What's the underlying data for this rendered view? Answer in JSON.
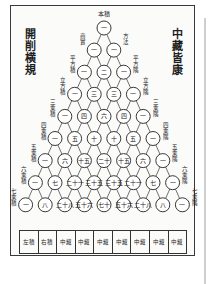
{
  "document": {
    "title_left": "開削横規",
    "title_right": "中藏皆康",
    "apex_label": "本積",
    "left_labels": [
      "商實",
      "平方積",
      "立方積",
      "三乘積",
      "四乘積",
      "五乘積",
      "六乘積",
      "七乘積"
    ],
    "right_labels": [
      "方法",
      "平方隅",
      "立方隅",
      "三乘隅",
      "四乘隅",
      "五乘隅",
      "六乘隅",
      "七乘隅"
    ],
    "triangle_rows": [
      [
        "一"
      ],
      [
        "一",
        "一"
      ],
      [
        "一",
        "二",
        "一"
      ],
      [
        "一",
        "三",
        "三",
        "一"
      ],
      [
        "一",
        "四",
        "六",
        "四",
        "一"
      ],
      [
        "一",
        "五",
        "十",
        "十",
        "五",
        "一"
      ],
      [
        "一",
        "六",
        "十五",
        "二十",
        "十五",
        "六",
        "一"
      ],
      [
        "一",
        "七",
        "二十一",
        "三十五",
        "三十五",
        "二十一",
        "七",
        "一"
      ],
      [
        "一",
        "八",
        "二十八",
        "五十六",
        "七十",
        "五十六",
        "二十八",
        "八",
        "一"
      ]
    ],
    "table_cells": [
      "左積",
      "右積",
      "中藏",
      "中藏",
      "中藏",
      "中藏",
      "中藏",
      "中藏",
      "中藏"
    ]
  }
}
